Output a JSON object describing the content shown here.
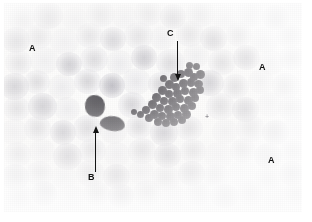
{
  "figure": {
    "kind": "light-micrograph",
    "background_color": "#ffffff",
    "plate_color": "#fdfdfc"
  },
  "annotations": {
    "labels": [
      {
        "id": "a1",
        "text": "A",
        "x": 29,
        "y": 44,
        "meaning": "erythrocyte"
      },
      {
        "id": "a2",
        "text": "A",
        "x": 259,
        "y": 63,
        "meaning": "erythrocyte"
      },
      {
        "id": "a3",
        "text": "A",
        "x": 268,
        "y": 156,
        "meaning": "erythrocyte"
      },
      {
        "id": "b",
        "text": "B",
        "x": 88,
        "y": 173,
        "meaning": "leukocyte"
      },
      {
        "id": "c",
        "text": "C",
        "x": 167,
        "y": 29,
        "meaning": "platelet clump"
      }
    ],
    "arrows": [
      {
        "id": "arrow-b",
        "direction": "up",
        "x": 95,
        "y_start": 172,
        "y_end": 132,
        "color": "#141414"
      },
      {
        "id": "arrow-c",
        "direction": "down",
        "x": 177,
        "y_start": 41,
        "y_end": 75,
        "color": "#141414"
      }
    ],
    "marks": [
      {
        "id": "field-cross",
        "text": "+",
        "x": 205,
        "y": 113
      }
    ]
  },
  "specimen": {
    "erythrocytes": [
      {
        "x": 8,
        "y": 6,
        "w": 27,
        "h": 25,
        "t": "n"
      },
      {
        "x": 33,
        "y": 2,
        "w": 30,
        "h": 27,
        "t": "d"
      },
      {
        "x": 62,
        "y": 7,
        "w": 26,
        "h": 24,
        "t": "l"
      },
      {
        "x": 86,
        "y": 1,
        "w": 29,
        "h": 26,
        "t": "n"
      },
      {
        "x": 112,
        "y": 5,
        "w": 25,
        "h": 24,
        "t": "l"
      },
      {
        "x": 134,
        "y": 0,
        "w": 28,
        "h": 26,
        "t": "n"
      },
      {
        "x": 160,
        "y": 4,
        "w": 26,
        "h": 25,
        "t": "d"
      },
      {
        "x": 186,
        "y": 0,
        "w": 29,
        "h": 27,
        "t": "n"
      },
      {
        "x": 212,
        "y": 6,
        "w": 26,
        "h": 24,
        "t": "l"
      },
      {
        "x": 236,
        "y": 1,
        "w": 28,
        "h": 26,
        "t": "n"
      },
      {
        "x": 262,
        "y": 5,
        "w": 27,
        "h": 25,
        "t": "d"
      },
      {
        "x": 282,
        "y": 0,
        "w": 24,
        "h": 24,
        "t": "l"
      },
      {
        "x": 2,
        "y": 27,
        "w": 28,
        "h": 26,
        "t": "d"
      },
      {
        "x": 26,
        "y": 24,
        "w": 26,
        "h": 25,
        "t": "n"
      },
      {
        "x": 50,
        "y": 28,
        "w": 29,
        "h": 27,
        "t": "l"
      },
      {
        "x": 76,
        "y": 23,
        "w": 27,
        "h": 25,
        "t": "n"
      },
      {
        "x": 100,
        "y": 27,
        "w": 26,
        "h": 24,
        "t": "d"
      },
      {
        "x": 124,
        "y": 22,
        "w": 29,
        "h": 27,
        "t": "n"
      },
      {
        "x": 150,
        "y": 26,
        "w": 25,
        "h": 24,
        "t": "l"
      },
      {
        "x": 176,
        "y": 21,
        "w": 28,
        "h": 26,
        "t": "n"
      },
      {
        "x": 200,
        "y": 26,
        "w": 27,
        "h": 25,
        "t": "d"
      },
      {
        "x": 226,
        "y": 22,
        "w": 26,
        "h": 25,
        "t": "n"
      },
      {
        "x": 250,
        "y": 27,
        "w": 29,
        "h": 26,
        "t": "l"
      },
      {
        "x": 276,
        "y": 23,
        "w": 26,
        "h": 25,
        "t": "n"
      },
      {
        "x": 5,
        "y": 50,
        "w": 27,
        "h": 25,
        "t": "n"
      },
      {
        "x": 30,
        "y": 47,
        "w": 29,
        "h": 27,
        "t": "l"
      },
      {
        "x": 56,
        "y": 52,
        "w": 26,
        "h": 24,
        "t": "d"
      },
      {
        "x": 80,
        "y": 46,
        "w": 28,
        "h": 26,
        "t": "n"
      },
      {
        "x": 106,
        "y": 50,
        "w": 27,
        "h": 25,
        "t": "l"
      },
      {
        "x": 131,
        "y": 45,
        "w": 26,
        "h": 25,
        "t": "d"
      },
      {
        "x": 156,
        "y": 49,
        "w": 29,
        "h": 27,
        "t": "n"
      },
      {
        "x": 183,
        "y": 44,
        "w": 26,
        "h": 24,
        "t": "l"
      },
      {
        "x": 208,
        "y": 49,
        "w": 28,
        "h": 26,
        "t": "n"
      },
      {
        "x": 233,
        "y": 45,
        "w": 27,
        "h": 25,
        "t": "d"
      },
      {
        "x": 258,
        "y": 50,
        "w": 26,
        "h": 25,
        "t": "l"
      },
      {
        "x": 279,
        "y": 46,
        "w": 25,
        "h": 24,
        "t": "n"
      },
      {
        "x": 0,
        "y": 73,
        "w": 29,
        "h": 27,
        "t": "d"
      },
      {
        "x": 24,
        "y": 70,
        "w": 26,
        "h": 24,
        "t": "n"
      },
      {
        "x": 48,
        "y": 74,
        "w": 28,
        "h": 26,
        "t": "l"
      },
      {
        "x": 74,
        "y": 69,
        "w": 27,
        "h": 25,
        "t": "n"
      },
      {
        "x": 99,
        "y": 73,
        "w": 26,
        "h": 25,
        "t": "d"
      },
      {
        "x": 122,
        "y": 68,
        "w": 29,
        "h": 27,
        "t": "l"
      },
      {
        "x": 148,
        "y": 72,
        "w": 25,
        "h": 24,
        "t": "n"
      },
      {
        "x": 196,
        "y": 70,
        "w": 28,
        "h": 26,
        "t": "d"
      },
      {
        "x": 222,
        "y": 74,
        "w": 27,
        "h": 25,
        "t": "n"
      },
      {
        "x": 248,
        "y": 69,
        "w": 26,
        "h": 25,
        "t": "l"
      },
      {
        "x": 272,
        "y": 73,
        "w": 28,
        "h": 26,
        "t": "n"
      },
      {
        "x": 3,
        "y": 96,
        "w": 27,
        "h": 25,
        "t": "n"
      },
      {
        "x": 28,
        "y": 93,
        "w": 29,
        "h": 27,
        "t": "d"
      },
      {
        "x": 54,
        "y": 97,
        "w": 26,
        "h": 24,
        "t": "l"
      },
      {
        "x": 118,
        "y": 92,
        "w": 28,
        "h": 26,
        "t": "n"
      },
      {
        "x": 144,
        "y": 96,
        "w": 26,
        "h": 25,
        "t": "l"
      },
      {
        "x": 206,
        "y": 93,
        "w": 29,
        "h": 27,
        "t": "n"
      },
      {
        "x": 232,
        "y": 97,
        "w": 27,
        "h": 25,
        "t": "d"
      },
      {
        "x": 257,
        "y": 92,
        "w": 26,
        "h": 25,
        "t": "l"
      },
      {
        "x": 278,
        "y": 96,
        "w": 26,
        "h": 25,
        "t": "n"
      },
      {
        "x": 0,
        "y": 119,
        "w": 28,
        "h": 26,
        "t": "l"
      },
      {
        "x": 24,
        "y": 116,
        "w": 27,
        "h": 25,
        "t": "n"
      },
      {
        "x": 50,
        "y": 120,
        "w": 26,
        "h": 25,
        "t": "d"
      },
      {
        "x": 73,
        "y": 115,
        "w": 29,
        "h": 27,
        "t": "n"
      },
      {
        "x": 100,
        "y": 119,
        "w": 27,
        "h": 25,
        "t": "l"
      },
      {
        "x": 126,
        "y": 115,
        "w": 26,
        "h": 24,
        "t": "n"
      },
      {
        "x": 150,
        "y": 120,
        "w": 28,
        "h": 26,
        "t": "d"
      },
      {
        "x": 176,
        "y": 116,
        "w": 27,
        "h": 25,
        "t": "n"
      },
      {
        "x": 212,
        "y": 119,
        "w": 26,
        "h": 25,
        "t": "l"
      },
      {
        "x": 236,
        "y": 115,
        "w": 29,
        "h": 27,
        "t": "n"
      },
      {
        "x": 262,
        "y": 120,
        "w": 27,
        "h": 25,
        "t": "d"
      },
      {
        "x": 283,
        "y": 116,
        "w": 24,
        "h": 24,
        "t": "l"
      },
      {
        "x": 4,
        "y": 142,
        "w": 27,
        "h": 25,
        "t": "n"
      },
      {
        "x": 29,
        "y": 139,
        "w": 26,
        "h": 24,
        "t": "l"
      },
      {
        "x": 53,
        "y": 143,
        "w": 29,
        "h": 27,
        "t": "d"
      },
      {
        "x": 79,
        "y": 138,
        "w": 27,
        "h": 25,
        "t": "n"
      },
      {
        "x": 104,
        "y": 142,
        "w": 26,
        "h": 25,
        "t": "l"
      },
      {
        "x": 128,
        "y": 138,
        "w": 28,
        "h": 26,
        "t": "n"
      },
      {
        "x": 154,
        "y": 143,
        "w": 27,
        "h": 25,
        "t": "d"
      },
      {
        "x": 180,
        "y": 139,
        "w": 26,
        "h": 24,
        "t": "n"
      },
      {
        "x": 204,
        "y": 142,
        "w": 29,
        "h": 27,
        "t": "l"
      },
      {
        "x": 230,
        "y": 138,
        "w": 26,
        "h": 25,
        "t": "n"
      },
      {
        "x": 254,
        "y": 143,
        "w": 28,
        "h": 26,
        "t": "d"
      },
      {
        "x": 280,
        "y": 139,
        "w": 25,
        "h": 24,
        "t": "n"
      },
      {
        "x": 1,
        "y": 164,
        "w": 28,
        "h": 26,
        "t": "d"
      },
      {
        "x": 26,
        "y": 161,
        "w": 27,
        "h": 25,
        "t": "n"
      },
      {
        "x": 51,
        "y": 165,
        "w": 26,
        "h": 24,
        "t": "l"
      },
      {
        "x": 76,
        "y": 160,
        "w": 29,
        "h": 27,
        "t": "n"
      },
      {
        "x": 103,
        "y": 164,
        "w": 27,
        "h": 25,
        "t": "d"
      },
      {
        "x": 128,
        "y": 160,
        "w": 26,
        "h": 25,
        "t": "l"
      },
      {
        "x": 152,
        "y": 165,
        "w": 28,
        "h": 26,
        "t": "n"
      },
      {
        "x": 178,
        "y": 161,
        "w": 27,
        "h": 25,
        "t": "d"
      },
      {
        "x": 203,
        "y": 164,
        "w": 26,
        "h": 24,
        "t": "n"
      },
      {
        "x": 228,
        "y": 160,
        "w": 29,
        "h": 27,
        "t": "l"
      },
      {
        "x": 255,
        "y": 165,
        "w": 26,
        "h": 25,
        "t": "n"
      },
      {
        "x": 279,
        "y": 161,
        "w": 25,
        "h": 25,
        "t": "d"
      },
      {
        "x": 6,
        "y": 184,
        "w": 27,
        "h": 24,
        "t": "n"
      },
      {
        "x": 31,
        "y": 181,
        "w": 26,
        "h": 25,
        "t": "d"
      },
      {
        "x": 56,
        "y": 185,
        "w": 29,
        "h": 24,
        "t": "l"
      },
      {
        "x": 83,
        "y": 181,
        "w": 27,
        "h": 25,
        "t": "n"
      },
      {
        "x": 108,
        "y": 184,
        "w": 26,
        "h": 24,
        "t": "d"
      },
      {
        "x": 133,
        "y": 180,
        "w": 28,
        "h": 26,
        "t": "n"
      },
      {
        "x": 160,
        "y": 185,
        "w": 27,
        "h": 24,
        "t": "l"
      },
      {
        "x": 185,
        "y": 181,
        "w": 26,
        "h": 25,
        "t": "n"
      },
      {
        "x": 210,
        "y": 184,
        "w": 29,
        "h": 24,
        "t": "d"
      },
      {
        "x": 237,
        "y": 180,
        "w": 26,
        "h": 26,
        "t": "n"
      },
      {
        "x": 262,
        "y": 185,
        "w": 27,
        "h": 24,
        "t": "l"
      },
      {
        "x": 284,
        "y": 181,
        "w": 23,
        "h": 25,
        "t": "n"
      }
    ],
    "leukocytes": [
      {
        "x": 85,
        "y": 95,
        "w": 20,
        "h": 22,
        "r": "48% 52% 45% 55% / 52% 48% 55% 45%",
        "rot": -8
      },
      {
        "x": 100,
        "y": 116,
        "w": 25,
        "h": 15,
        "r": "55% 45% 50% 50% / 60% 55% 45% 40%",
        "rot": 10
      }
    ],
    "platelets": [
      {
        "x": 170,
        "y": 73,
        "w": 9,
        "h": 9
      },
      {
        "x": 177,
        "y": 70,
        "w": 8,
        "h": 8
      },
      {
        "x": 184,
        "y": 68,
        "w": 9,
        "h": 9
      },
      {
        "x": 190,
        "y": 73,
        "w": 8,
        "h": 8
      },
      {
        "x": 196,
        "y": 70,
        "w": 9,
        "h": 9
      },
      {
        "x": 165,
        "y": 80,
        "w": 9,
        "h": 9
      },
      {
        "x": 172,
        "y": 83,
        "w": 8,
        "h": 8
      },
      {
        "x": 179,
        "y": 79,
        "w": 9,
        "h": 9
      },
      {
        "x": 187,
        "y": 78,
        "w": 8,
        "h": 9
      },
      {
        "x": 194,
        "y": 80,
        "w": 9,
        "h": 8
      },
      {
        "x": 158,
        "y": 86,
        "w": 9,
        "h": 9
      },
      {
        "x": 165,
        "y": 90,
        "w": 8,
        "h": 8
      },
      {
        "x": 173,
        "y": 89,
        "w": 9,
        "h": 9
      },
      {
        "x": 181,
        "y": 87,
        "w": 8,
        "h": 8
      },
      {
        "x": 189,
        "y": 88,
        "w": 9,
        "h": 9
      },
      {
        "x": 196,
        "y": 86,
        "w": 8,
        "h": 8
      },
      {
        "x": 152,
        "y": 93,
        "w": 9,
        "h": 9
      },
      {
        "x": 160,
        "y": 97,
        "w": 8,
        "h": 8
      },
      {
        "x": 168,
        "y": 97,
        "w": 9,
        "h": 9
      },
      {
        "x": 176,
        "y": 95,
        "w": 8,
        "h": 8
      },
      {
        "x": 184,
        "y": 96,
        "w": 9,
        "h": 9
      },
      {
        "x": 191,
        "y": 94,
        "w": 8,
        "h": 8
      },
      {
        "x": 148,
        "y": 100,
        "w": 9,
        "h": 9
      },
      {
        "x": 156,
        "y": 104,
        "w": 8,
        "h": 8
      },
      {
        "x": 164,
        "y": 105,
        "w": 9,
        "h": 9
      },
      {
        "x": 172,
        "y": 103,
        "w": 8,
        "h": 8
      },
      {
        "x": 180,
        "y": 104,
        "w": 9,
        "h": 9
      },
      {
        "x": 188,
        "y": 102,
        "w": 8,
        "h": 8
      },
      {
        "x": 142,
        "y": 106,
        "w": 8,
        "h": 8
      },
      {
        "x": 150,
        "y": 110,
        "w": 9,
        "h": 9
      },
      {
        "x": 158,
        "y": 112,
        "w": 8,
        "h": 8
      },
      {
        "x": 166,
        "y": 112,
        "w": 9,
        "h": 9
      },
      {
        "x": 174,
        "y": 111,
        "w": 8,
        "h": 8
      },
      {
        "x": 182,
        "y": 110,
        "w": 9,
        "h": 9
      },
      {
        "x": 137,
        "y": 111,
        "w": 7,
        "h": 7
      },
      {
        "x": 145,
        "y": 114,
        "w": 8,
        "h": 8
      },
      {
        "x": 154,
        "y": 118,
        "w": 8,
        "h": 8
      },
      {
        "x": 162,
        "y": 119,
        "w": 8,
        "h": 8
      },
      {
        "x": 170,
        "y": 118,
        "w": 8,
        "h": 8
      },
      {
        "x": 178,
        "y": 116,
        "w": 8,
        "h": 8
      },
      {
        "x": 131,
        "y": 109,
        "w": 6,
        "h": 6
      },
      {
        "x": 186,
        "y": 62,
        "w": 7,
        "h": 7
      },
      {
        "x": 193,
        "y": 63,
        "w": 7,
        "h": 7
      },
      {
        "x": 160,
        "y": 75,
        "w": 7,
        "h": 7
      }
    ]
  }
}
